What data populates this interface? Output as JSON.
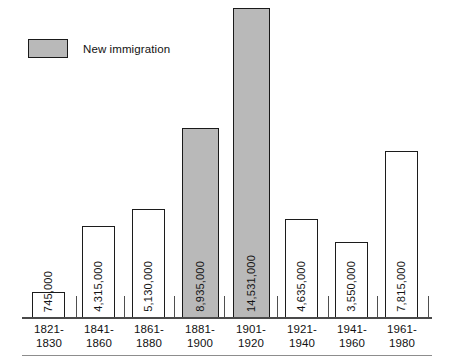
{
  "legend": {
    "label": "New immigration",
    "swatch_color": "#b9b9b9",
    "swatch_border": "#1a1a1a"
  },
  "axis": {
    "baseline_color": "#4a4a4a",
    "footer_rule_color": "#8d8d8d"
  },
  "chart_data": {
    "type": "bar",
    "title": "",
    "subtitle": "",
    "xlabel": "",
    "ylabel": "",
    "grid": false,
    "legend_position": "top-left",
    "axis_ticks_visible": false,
    "ylim": [
      0,
      14531000
    ],
    "categories": [
      "1821-\n1830",
      "1841-\n1860",
      "1861-\n1880",
      "1881-\n1900",
      "1901-\n1920",
      "1921-\n1940",
      "1941-\n1960",
      "1961-\n1980"
    ],
    "category_lines": [
      [
        "1821-",
        "1830"
      ],
      [
        "1841-",
        "1860"
      ],
      [
        "1861-",
        "1880"
      ],
      [
        "1881-",
        "1900"
      ],
      [
        "1901-",
        "1920"
      ],
      [
        "1921-",
        "1940"
      ],
      [
        "1941-",
        "1960"
      ],
      [
        "1961-",
        "1980"
      ]
    ],
    "values": [
      745000,
      4315000,
      5130000,
      8935000,
      14531000,
      4635000,
      3550000,
      7815000
    ],
    "value_labels": [
      "745,000",
      "4,315,000",
      "5,130,000",
      "8,935,000",
      "14,531,000",
      "4,635,000",
      "3,550,000",
      "7,815,000"
    ],
    "series": [
      {
        "name": "New immigration",
        "highlighted_categories": [
          "1881-\n1900",
          "1901-\n1920"
        ]
      }
    ],
    "bar_shaded": [
      false,
      false,
      false,
      true,
      true,
      false,
      false,
      false
    ],
    "annotations": []
  },
  "geometry": {
    "bars": [
      {
        "left": 32,
        "width": 33,
        "height": 26,
        "label_x": 23,
        "label_w": 52
      },
      {
        "left": 82,
        "width": 33,
        "height": 92,
        "label_x": 73,
        "label_w": 52
      },
      {
        "left": 132,
        "width": 33,
        "height": 109,
        "label_x": 123,
        "label_w": 52
      },
      {
        "left": 182,
        "width": 37,
        "height": 190,
        "label_x": 174,
        "label_w": 52
      },
      {
        "left": 233,
        "width": 37,
        "height": 310,
        "label_x": 225,
        "label_w": 52
      },
      {
        "left": 285,
        "width": 33,
        "height": 99,
        "label_x": 276,
        "label_w": 52
      },
      {
        "left": 335,
        "width": 33,
        "height": 76,
        "label_x": 326,
        "label_w": 52
      },
      {
        "left": 385,
        "width": 33,
        "height": 167,
        "label_x": 376,
        "label_w": 52
      }
    ],
    "ticks": [
      {
        "left": 76,
        "height": 22
      },
      {
        "left": 124,
        "height": 22
      },
      {
        "left": 174,
        "height": 22
      },
      {
        "left": 224,
        "height": 22
      },
      {
        "left": 277,
        "height": 22
      },
      {
        "left": 328,
        "height": 22
      },
      {
        "left": 377,
        "height": 22
      },
      {
        "left": 428,
        "height": 22
      }
    ]
  }
}
